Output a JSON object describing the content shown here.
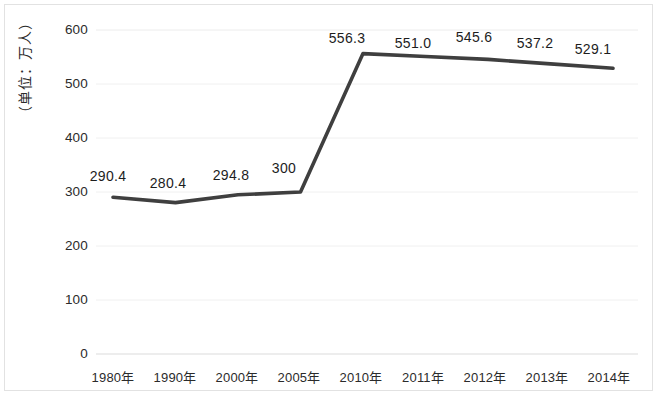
{
  "chart_data": {
    "type": "line",
    "title": "",
    "subtitle": "",
    "xlabel": "",
    "ylabel": "（单位：万人）",
    "categories": [
      "1980年",
      "1990年",
      "2000年",
      "2005年",
      "2010年",
      "2011年",
      "2012年",
      "2013年",
      "2014年"
    ],
    "values": [
      290.4,
      280.4,
      294.8,
      300,
      556.3,
      551.0,
      545.6,
      537.2,
      529.1
    ],
    "point_labels": [
      "290.4",
      "280.4",
      "294.8",
      "300",
      "556.3",
      "551.0",
      "545.6",
      "537.2",
      "529.1"
    ],
    "series": [
      {
        "name": "",
        "values": [
          290.4,
          280.4,
          294.8,
          300,
          556.3,
          551.0,
          545.6,
          537.2,
          529.1
        ]
      }
    ],
    "ylim": [
      0,
      600
    ],
    "ytick_labels": [
      "600",
      "500",
      "400",
      "300",
      "200",
      "100",
      "0"
    ],
    "ytick_values": [
      600,
      500,
      400,
      300,
      200,
      100,
      0
    ],
    "grid": true,
    "legend": "none",
    "line_color": "#3f3f3f",
    "grid_color": "#ededed",
    "text_color": "#2b2b2b"
  }
}
